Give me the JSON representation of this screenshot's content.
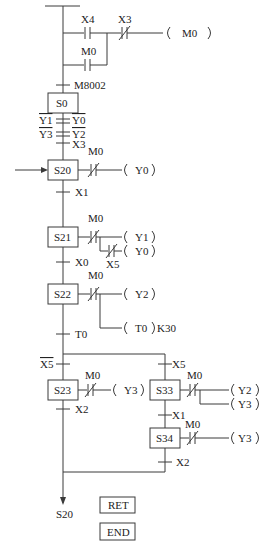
{
  "ladder": {
    "x4": "X4",
    "x3": "X3",
    "m0_contact": "M0",
    "m0_coil": "M0",
    "m8002": "M8002"
  },
  "steps": {
    "s0": "S0",
    "s20": "S20",
    "s21": "S21",
    "s22": "S22",
    "s23": "S23",
    "s33": "S33",
    "s34": "S34"
  },
  "s0_conditions": {
    "y1": "Y1",
    "y0": "Y0",
    "y3": "Y3",
    "y2": "Y2",
    "x3": "X3"
  },
  "transitions": {
    "x1": "X1",
    "x0": "X0",
    "t0": "T0",
    "x5_bar": "X5",
    "x5": "X5",
    "x2_left": "X2",
    "x1_right": "X1",
    "x2_right": "X2"
  },
  "actions": {
    "s20": {
      "contact": "M0",
      "coil": "Y0"
    },
    "s21": {
      "contact": "M0",
      "coil1": "Y1",
      "contact2": "X5",
      "coil2": "Y0"
    },
    "s22": {
      "contact": "M0",
      "coil1": "Y2",
      "coil2": "T0",
      "k": "K30"
    },
    "s23": {
      "contact": "M0",
      "coil": "Y3"
    },
    "s33": {
      "contact": "M0",
      "coil1": "Y2",
      "coil2": "Y3"
    },
    "s34": {
      "contact": "M0",
      "coil": "Y3"
    }
  },
  "jump_target": "S20",
  "instructions": {
    "ret": "RET",
    "end": "END"
  }
}
